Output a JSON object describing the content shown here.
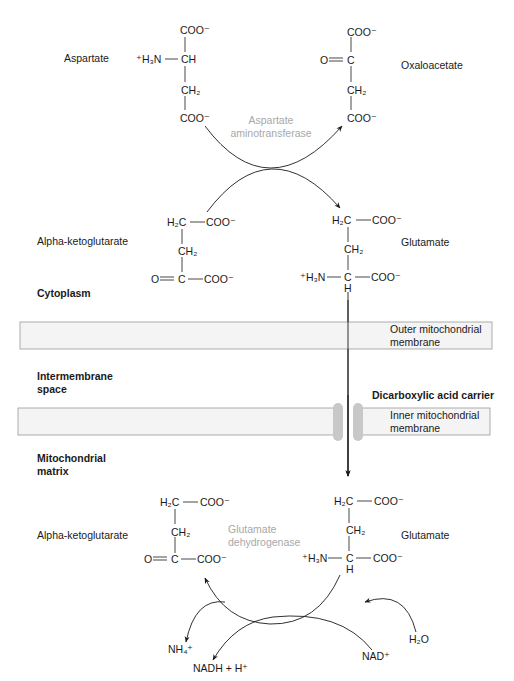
{
  "diagram": {
    "type": "biochemical-pathway"
  },
  "molecules": {
    "aspartate": {
      "name": "Aspartate",
      "top": "COO⁻",
      "amine": "⁺H₃N",
      "center": "CH",
      "middle": "CH₂",
      "bottom": "COO⁻"
    },
    "oxaloacetate": {
      "name": "Oxaloacetate",
      "top": "COO⁻",
      "keto": "O",
      "center": "C",
      "middle": "CH₂",
      "bottom": "COO⁻"
    },
    "alpha_kg_cyto": {
      "name": "Alpha-ketoglutarate",
      "top_left": "H₂C",
      "top_right": "COO⁻",
      "middle": "CH₂",
      "keto": "O",
      "center": "C",
      "right": "COO⁻"
    },
    "glutamate_cyto": {
      "name": "Glutamate",
      "top_left": "H₂C",
      "top_right": "COO⁻",
      "middle": "CH₂",
      "amine": "⁺H₃N",
      "center": "C",
      "h": "H",
      "right": "COO⁻"
    },
    "alpha_kg_matrix": {
      "name": "Alpha-ketoglutarate",
      "top_left": "H₂C",
      "top_right": "COO⁻",
      "middle": "CH₂",
      "keto": "O",
      "center": "C",
      "right": "COO⁻"
    },
    "glutamate_matrix": {
      "name": "Glutamate",
      "top_left": "H₂C",
      "top_right": "COO⁻",
      "middle": "CH₂",
      "amine": "⁺H₃N",
      "center": "C",
      "h": "H",
      "right": "COO⁻"
    }
  },
  "enzymes": {
    "aspartate_aminotransferase": {
      "line1": "Aspartate",
      "line2": "aminotransferase",
      "color": "#a8a8a8"
    },
    "glutamate_dehydrogenase": {
      "line1": "Glutamate",
      "line2": "dehydrogenase",
      "color": "#a8a8a8"
    }
  },
  "compartments": {
    "cytoplasm": "Cytoplasm",
    "intermembrane_line1": "Intermembrane",
    "intermembrane_line2": "space",
    "matrix_line1": "Mitochondrial",
    "matrix_line2": "matrix"
  },
  "membranes": {
    "outer_line1": "Outer mitochondrial",
    "outer_line2": "membrane",
    "inner_line1": "Inner mitochondrial",
    "inner_line2": "membrane",
    "carrier": "Dicarboxylic acid carrier",
    "membrane_fill": "#f4f4f4",
    "membrane_border": "#9a9a9a",
    "carrier_color": "#c8c8c8"
  },
  "cofactors": {
    "nh4": "NH₄⁺",
    "nadh": "NADH + H⁺",
    "nad": "NAD⁺",
    "h2o": "H₂O"
  }
}
